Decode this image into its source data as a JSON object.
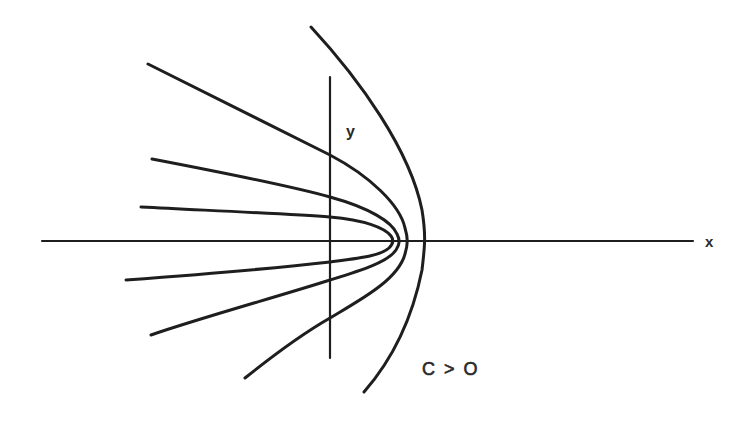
{
  "figure": {
    "type": "diagram",
    "labels": {
      "x_axis": "x",
      "y_axis": "y",
      "condition": "C > O"
    },
    "colors": {
      "background": "#ffffff",
      "ink": "#1e1e1e"
    },
    "axes": {
      "x_axis": {
        "from": [
          42,
          241
        ],
        "to": [
          693,
          241
        ]
      },
      "y_axis": {
        "from": [
          330,
          77
        ],
        "to": [
          330,
          358
        ]
      }
    },
    "curves": [
      {
        "name": "outer-curve",
        "vertex": [
          424,
          241
        ],
        "upper_end": [
          311,
          27
        ],
        "lower_end": [
          364,
          392
        ]
      },
      {
        "name": "curve-2",
        "vertex": [
          406,
          241
        ],
        "upper_end": [
          148,
          64
        ],
        "lower_end": [
          245,
          378
        ]
      },
      {
        "name": "curve-3",
        "vertex": [
          398,
          241
        ],
        "upper_end": [
          152,
          159
        ],
        "lower_end": [
          151,
          335
        ]
      },
      {
        "name": "curve-4",
        "vertex": [
          392,
          241
        ],
        "upper_end": [
          141,
          207
        ],
        "lower_end": [
          126,
          280
        ]
      }
    ]
  }
}
